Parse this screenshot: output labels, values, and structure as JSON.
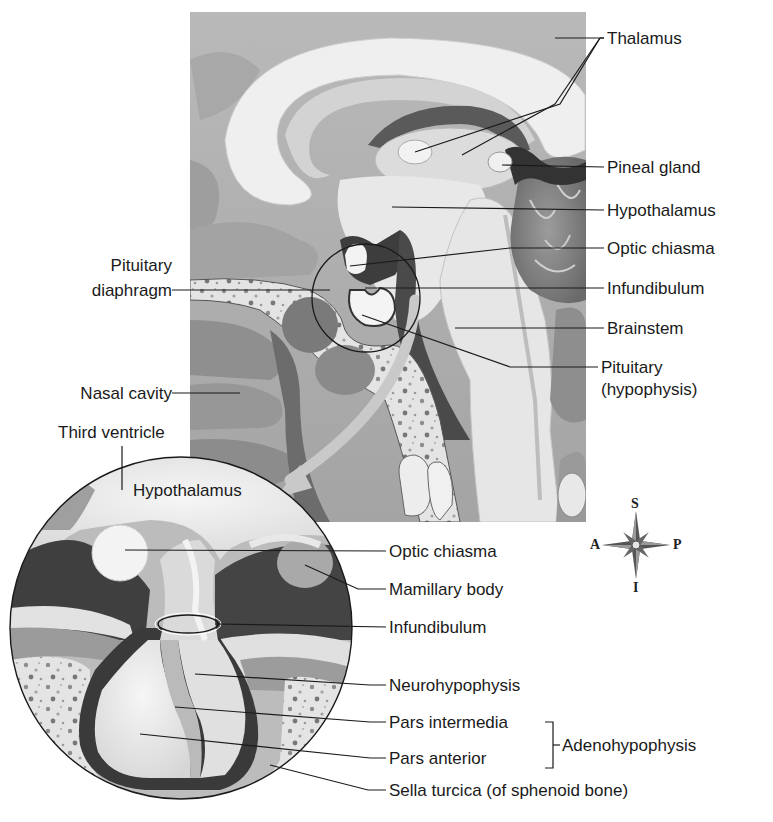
{
  "figure": {
    "colors": {
      "background": "#ffffff",
      "tissue_light": "#e9e9e9",
      "tissue_mid": "#bdbdbd",
      "tissue_dark": "#6f6f6f",
      "tissue_darkest": "#3a3a3a",
      "leader_line": "#1a1a1a"
    }
  },
  "upper_labels": {
    "right": [
      {
        "id": "thalamus",
        "text": "Thalamus"
      },
      {
        "id": "pineal-gland",
        "text": "Pineal gland"
      },
      {
        "id": "hypothalamus",
        "text": "Hypothalamus"
      },
      {
        "id": "optic-chiasma",
        "text": "Optic chiasma"
      },
      {
        "id": "infundibulum",
        "text": "Infundibulum"
      },
      {
        "id": "brainstem",
        "text": "Brainstem"
      },
      {
        "id": "pituitary",
        "text": "Pituitary",
        "text2": "(hypophysis)"
      }
    ],
    "left": [
      {
        "id": "pituitary-diaphragm",
        "text": "Pituitary",
        "text2": "diaphragm"
      },
      {
        "id": "nasal-cavity",
        "text": "Nasal cavity"
      },
      {
        "id": "third-ventricle",
        "text": "Third ventricle"
      }
    ]
  },
  "inset": {
    "inner_label": "Hypothalamus",
    "labels": [
      {
        "id": "optic-chiasma",
        "text": "Optic chiasma"
      },
      {
        "id": "mamillary-body",
        "text": "Mamillary body"
      },
      {
        "id": "infundibulum",
        "text": "Infundibulum"
      },
      {
        "id": "neurohypophysis",
        "text": "Neurohypophysis"
      },
      {
        "id": "pars-intermedia",
        "text": "Pars intermedia"
      },
      {
        "id": "pars-anterior",
        "text": "Pars anterior"
      },
      {
        "id": "sella-turcica",
        "text": "Sella turcica (of sphenoid bone)"
      }
    ],
    "bracket_label": "Adenohypophysis"
  },
  "compass": {
    "icon": "compass-rose-icon",
    "superior": "S",
    "inferior": "I",
    "anterior": "A",
    "posterior": "P"
  }
}
